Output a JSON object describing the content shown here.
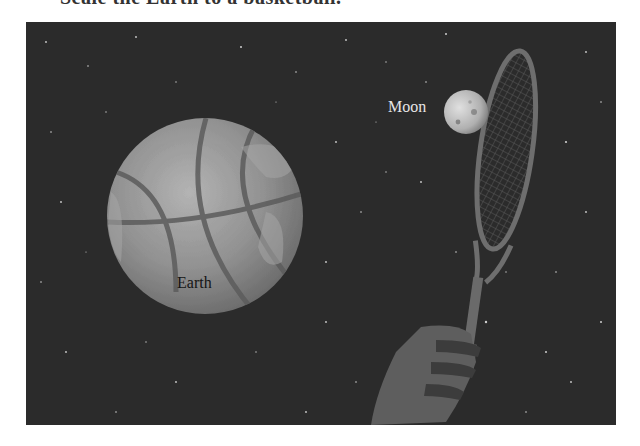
{
  "caption": {
    "text": "Scale the Earth to a basketball."
  },
  "scene": {
    "background_color": "#2b2b2b",
    "earth": {
      "label": "Earth",
      "fill": "#8e8e8e",
      "seam_color": "#5a5a5a"
    },
    "moon": {
      "label": "Moon",
      "fill": "#bdbdbd"
    },
    "racket": {
      "frame_color": "#6e6e6e",
      "string_color": "#555555"
    },
    "hand": {
      "fill": "#5e5e5e",
      "shadow": "#3c3c3c"
    }
  }
}
